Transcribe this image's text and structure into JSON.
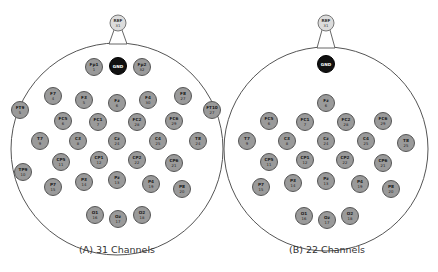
{
  "panels": [
    {
      "id": "A",
      "caption": "(A) 31 Channels",
      "head": {
        "cx": 117,
        "cy": 149,
        "r": 106
      },
      "ref": {
        "label": "REF",
        "num": "31",
        "x": 118,
        "y": 23
      },
      "gnd": {
        "label": "GND",
        "x": 118,
        "y": 66
      },
      "electrodes": [
        {
          "label": "Fp1",
          "num": "1",
          "x": 94,
          "y": 67
        },
        {
          "label": "Fp2",
          "num": "32",
          "x": 142,
          "y": 67
        },
        {
          "label": "F7",
          "num": "4",
          "x": 53,
          "y": 96
        },
        {
          "label": "F3",
          "num": "5",
          "x": 84,
          "y": 100
        },
        {
          "label": "Fz",
          "num": "6",
          "x": 117,
          "y": 103
        },
        {
          "label": "F4",
          "num": "30",
          "x": 148,
          "y": 100
        },
        {
          "label": "F8",
          "num": "27",
          "x": 183,
          "y": 96
        },
        {
          "label": "FT9",
          "num": "5",
          "x": 20,
          "y": 110
        },
        {
          "label": "FT10",
          "num": "27",
          "x": 212,
          "y": 110
        },
        {
          "label": "FC5",
          "num": "6",
          "x": 63,
          "y": 121
        },
        {
          "label": "FC1",
          "num": "7",
          "x": 98,
          "y": 122
        },
        {
          "label": "FC2",
          "num": "28",
          "x": 137,
          "y": 122
        },
        {
          "label": "FC6",
          "num": "29",
          "x": 174,
          "y": 121
        },
        {
          "label": "T7",
          "num": "9",
          "x": 40,
          "y": 141
        },
        {
          "label": "C3",
          "num": "8",
          "x": 78,
          "y": 141
        },
        {
          "label": "Cz",
          "num": "24",
          "x": 117,
          "y": 141
        },
        {
          "label": "C4",
          "num": "25",
          "x": 158,
          "y": 141
        },
        {
          "label": "T8",
          "num": "24",
          "x": 198,
          "y": 141
        },
        {
          "label": "TP9",
          "num": "10",
          "x": 23,
          "y": 172
        },
        {
          "label": "CP5",
          "num": "11",
          "x": 61,
          "y": 162
        },
        {
          "label": "CP1",
          "num": "12",
          "x": 99,
          "y": 160
        },
        {
          "label": "CP2",
          "num": "22",
          "x": 137,
          "y": 160
        },
        {
          "label": "CP6",
          "num": "21",
          "x": 174,
          "y": 163
        },
        {
          "label": "P7",
          "num": "15",
          "x": 53,
          "y": 187
        },
        {
          "label": "P3",
          "num": "14",
          "x": 84,
          "y": 182
        },
        {
          "label": "Pz",
          "num": "13",
          "x": 117,
          "y": 180
        },
        {
          "label": "P4",
          "num": "19",
          "x": 151,
          "y": 184
        },
        {
          "label": "P8",
          "num": "20",
          "x": 182,
          "y": 189
        },
        {
          "label": "O1",
          "num": "16",
          "x": 95,
          "y": 215
        },
        {
          "label": "Oz",
          "num": "17",
          "x": 118,
          "y": 219
        },
        {
          "label": "O2",
          "num": "18",
          "x": 142,
          "y": 215
        }
      ]
    },
    {
      "id": "B",
      "caption": "(B) 22 Channels",
      "head": {
        "cx": 326,
        "cy": 149,
        "r": 102
      },
      "ref": {
        "label": "REF",
        "num": "31",
        "x": 326,
        "y": 23
      },
      "gnd": {
        "label": "GND",
        "x": 326,
        "y": 64
      },
      "electrodes": [
        {
          "label": "Fz",
          "num": "6",
          "x": 326,
          "y": 103
        },
        {
          "label": "FC5",
          "num": "6",
          "x": 269,
          "y": 121
        },
        {
          "label": "FC1",
          "num": "7",
          "x": 305,
          "y": 122
        },
        {
          "label": "FC2",
          "num": "28",
          "x": 346,
          "y": 122
        },
        {
          "label": "FC6",
          "num": "29",
          "x": 383,
          "y": 121
        },
        {
          "label": "T7",
          "num": "9",
          "x": 247,
          "y": 141
        },
        {
          "label": "C3",
          "num": "8",
          "x": 287,
          "y": 141
        },
        {
          "label": "Cz",
          "num": "24",
          "x": 326,
          "y": 141
        },
        {
          "label": "C4",
          "num": "25",
          "x": 366,
          "y": 141
        },
        {
          "label": "T8",
          "num": "25",
          "x": 406,
          "y": 143
        },
        {
          "label": "CP5",
          "num": "11",
          "x": 269,
          "y": 162
        },
        {
          "label": "CP1",
          "num": "12",
          "x": 305,
          "y": 160
        },
        {
          "label": "CP2",
          "num": "22",
          "x": 345,
          "y": 160
        },
        {
          "label": "CP6",
          "num": "21",
          "x": 383,
          "y": 163
        },
        {
          "label": "P7",
          "num": "15",
          "x": 261,
          "y": 187
        },
        {
          "label": "P3",
          "num": "14",
          "x": 293,
          "y": 183
        },
        {
          "label": "Pz",
          "num": "13",
          "x": 326,
          "y": 181
        },
        {
          "label": "P4",
          "num": "19",
          "x": 360,
          "y": 184
        },
        {
          "label": "P8",
          "num": "20",
          "x": 391,
          "y": 189
        },
        {
          "label": "O1",
          "num": "16",
          "x": 304,
          "y": 216
        },
        {
          "label": "Oz",
          "num": "17",
          "x": 327,
          "y": 220
        },
        {
          "label": "O2",
          "num": "18",
          "x": 350,
          "y": 216
        }
      ]
    }
  ],
  "colors": {
    "electrode_fill": "#9a9a9a",
    "electrode_stroke": "#555555",
    "ref_fill": "#dcdcdc",
    "gnd_fill": "#111111",
    "head_stroke": "#555555",
    "text": "#222222"
  }
}
